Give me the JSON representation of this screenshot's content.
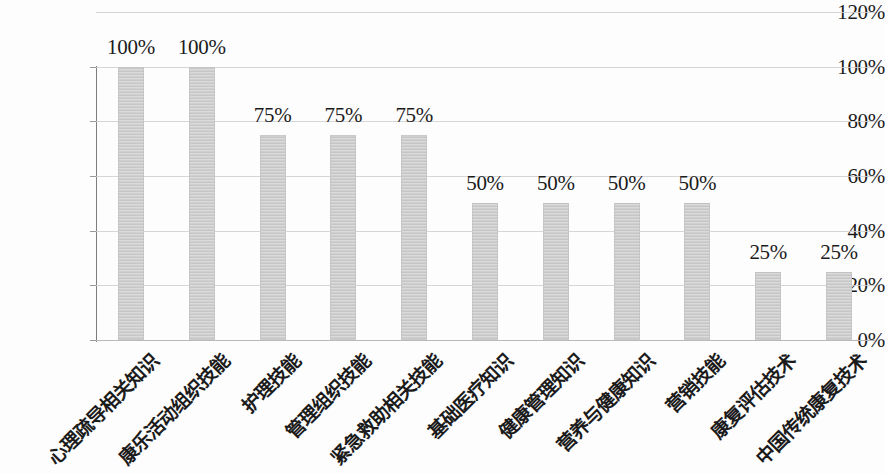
{
  "chart": {
    "type": "bar",
    "y_axis": {
      "ticks": [
        "0%",
        "20%",
        "40%",
        "60%",
        "80%",
        "100%",
        "120%"
      ],
      "min": 0,
      "max": 120
    },
    "grid": "horizontal",
    "legend": "none",
    "bar_color": "#c9c9c9"
  },
  "chart_data": {
    "type": "bar",
    "title": "",
    "subtitle": "",
    "xlabel": "",
    "ylabel": "",
    "ylim": [
      0,
      120
    ],
    "yticks": [
      0,
      20,
      40,
      60,
      80,
      100,
      120
    ],
    "ytick_labels": [
      "0%",
      "20%",
      "40%",
      "60%",
      "80%",
      "100%",
      "120%"
    ],
    "grid": true,
    "legend": null,
    "categories": [
      "心理疏导相关知识",
      "康乐活动组织技能",
      "护理技能",
      "管理组织技能",
      "紧急救助相关技能",
      "基础医疗知识",
      "健康管理知识",
      "营养与健康知识",
      "营销技能",
      "康复评估技术",
      "中国传统康复技术"
    ],
    "values": [
      100,
      100,
      75,
      75,
      75,
      50,
      50,
      50,
      50,
      25,
      25
    ],
    "data_labels": [
      "100%",
      "100%",
      "75%",
      "75%",
      "75%",
      "50%",
      "50%",
      "50%",
      "50%",
      "25%",
      "25%"
    ]
  }
}
